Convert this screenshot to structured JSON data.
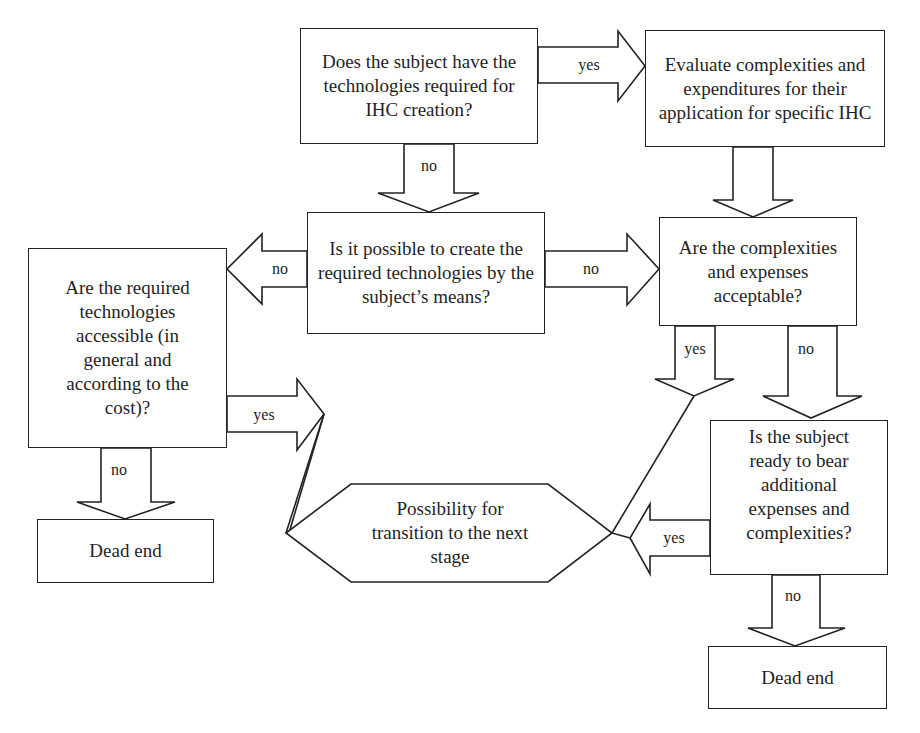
{
  "colors": {
    "stroke": "#222222",
    "text": "#1f1f1f",
    "background": "#ffffff"
  },
  "nodes": {
    "has_technologies": {
      "text": "Does the subject have the technologies required for IHC creation?"
    },
    "evaluate": {
      "text": "Evaluate complexities and expenditures for their application for specific IHC"
    },
    "possible_create": {
      "text": "Is it possible to create the required technologies by the subject’s means?"
    },
    "acceptable": {
      "text": "Are the complexities and expenses acceptable?"
    },
    "accessible": {
      "text": "Are the required technologies accessible (in general and according to the cost)?"
    },
    "ready_to_bear": {
      "text": "Is the subject ready to bear additional expenses and complexities?"
    },
    "dead_end_left": {
      "text": "Dead end"
    },
    "dead_end_right": {
      "text": "Dead end"
    },
    "transition": {
      "text": "Possibility for transition to the next stage"
    }
  },
  "edges": [
    {
      "from": "has_technologies",
      "to": "evaluate",
      "label": "yes"
    },
    {
      "from": "has_technologies",
      "to": "possible_create",
      "label": "no"
    },
    {
      "from": "evaluate",
      "to": "acceptable",
      "label": ""
    },
    {
      "from": "possible_create",
      "to": "accessible",
      "label": "no"
    },
    {
      "from": "possible_create",
      "to": "acceptable",
      "label": "no"
    },
    {
      "from": "acceptable",
      "to": "transition",
      "label": "yes"
    },
    {
      "from": "acceptable",
      "to": "ready_to_bear",
      "label": "no"
    },
    {
      "from": "accessible",
      "to": "transition",
      "label": "yes"
    },
    {
      "from": "accessible",
      "to": "dead_end_left",
      "label": "no"
    },
    {
      "from": "ready_to_bear",
      "to": "transition",
      "label": "yes"
    },
    {
      "from": "ready_to_bear",
      "to": "dead_end_right",
      "label": "no"
    }
  ]
}
